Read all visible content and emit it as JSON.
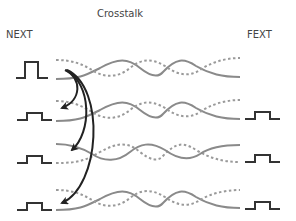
{
  "title": "Crosstalk",
  "labels": {
    "near_end": "NEXT",
    "far_end": "FEXT"
  },
  "colors": {
    "pulse": "#333333",
    "solid_wire": "#8a8a8a",
    "dashed_wire": "#9a9a9a",
    "arrow": "#222222",
    "text": "#444444"
  },
  "pairs": [
    {
      "id": "pair-1",
      "y": 70,
      "role": "disturbing",
      "near_pulse": "large",
      "far_pulse": "none"
    },
    {
      "id": "pair-2",
      "y": 114,
      "role": "victim",
      "near_pulse": "small",
      "far_pulse": "small"
    },
    {
      "id": "pair-3",
      "y": 156,
      "role": "victim",
      "near_pulse": "small",
      "far_pulse": "small"
    },
    {
      "id": "pair-4",
      "y": 199,
      "role": "victim",
      "near_pulse": "small",
      "far_pulse": "small"
    }
  ],
  "arrows": [
    {
      "from": "pair-1",
      "to": "pair-2"
    },
    {
      "from": "pair-1",
      "to": "pair-3"
    },
    {
      "from": "pair-1",
      "to": "pair-4"
    }
  ]
}
